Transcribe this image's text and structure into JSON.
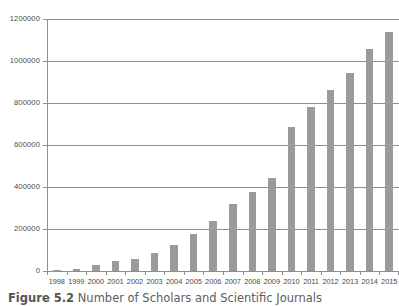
{
  "chart_data": {
    "type": "bar",
    "title": "",
    "xlabel": "",
    "ylabel": "",
    "categories": [
      "1998",
      "1999",
      "2000",
      "2001",
      "2002",
      "2003",
      "2004",
      "2005",
      "2006",
      "2007",
      "2008",
      "2009",
      "2010",
      "2011",
      "2012",
      "2013",
      "2014",
      "2015"
    ],
    "values": [
      2000,
      9000,
      28000,
      46000,
      58000,
      84000,
      125000,
      178000,
      238000,
      318000,
      378000,
      442000,
      685000,
      780000,
      860000,
      945000,
      1058000,
      1140000
    ],
    "ylim": [
      0,
      1200000
    ],
    "ytick_labels": [
      "1200000",
      "1000000",
      "800000",
      "600000",
      "400000",
      "200000",
      "0"
    ],
    "ytick_values": [
      1200000,
      1000000,
      800000,
      600000,
      400000,
      200000,
      0
    ],
    "grid": true,
    "legend": "none",
    "bar_color": "#9a9a9a",
    "axis_color": "#8e8e8e",
    "background": "#ffffff"
  },
  "caption": {
    "number": "Figure 5.2",
    "text": "Number of Scholars and Scientific Journals"
  }
}
